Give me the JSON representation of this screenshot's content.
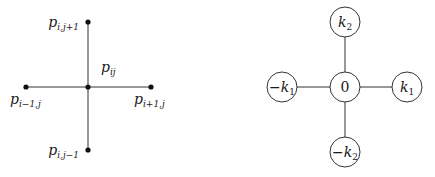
{
  "left_diagram": {
    "title": "grid stencil",
    "center": {
      "base": "p",
      "sub": "ij"
    },
    "top": {
      "base": "p",
      "sub": "i,j+1"
    },
    "bottom": {
      "base": "p",
      "sub": "i,j−1"
    },
    "left": {
      "base": "p",
      "sub": "i−1,j"
    },
    "right": {
      "base": "p",
      "sub": "i+1,j"
    }
  },
  "right_diagram": {
    "title": "frequency stencil",
    "center": {
      "label": "0"
    },
    "top": {
      "prefix": "",
      "base": "k",
      "sub": "2"
    },
    "bottom": {
      "prefix": "−",
      "base": "k",
      "sub": "2"
    },
    "left": {
      "prefix": "−",
      "base": "k",
      "sub": "1"
    },
    "right": {
      "prefix": "",
      "base": "k",
      "sub": "1"
    }
  },
  "colors": {
    "line": "#333333",
    "dot": "#111111",
    "text": "#1a1a1a"
  }
}
